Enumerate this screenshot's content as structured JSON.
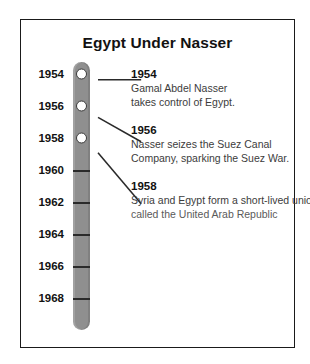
{
  "title": "Egypt Under Nasser",
  "axis": {
    "years": [
      {
        "label": "1954",
        "value": 1954
      },
      {
        "label": "1956",
        "value": 1956
      },
      {
        "label": "1958",
        "value": 1958
      },
      {
        "label": "1960",
        "value": 1960
      },
      {
        "label": "1962",
        "value": 1962
      },
      {
        "label": "1964",
        "value": 1964
      },
      {
        "label": "1966",
        "value": 1966
      },
      {
        "label": "1968",
        "value": 1968
      }
    ],
    "start": 1954,
    "end": 1968,
    "step": 2,
    "orientation": "vertical",
    "bar_color": "#8f8f8f"
  },
  "events": [
    {
      "year": "1954",
      "lines": [
        "Gamal Abdel Nasser",
        "takes control of Egypt."
      ]
    },
    {
      "year": "1956",
      "lines": [
        "Nasser seizes the Suez Canal",
        "Company, sparking the Suez War."
      ]
    },
    {
      "year": "1958",
      "lines": [
        "Syria and Egypt form a short-lived union",
        "called the United Arab Republic"
      ]
    }
  ]
}
